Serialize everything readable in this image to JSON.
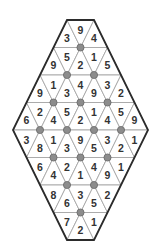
{
  "puzzle": {
    "type": "triangular-hexagon-number-grid",
    "rows": [
      [
        "3",
        "9",
        "4"
      ],
      [
        "9",
        "5",
        "2",
        "1",
        "5"
      ],
      [
        "9",
        "1",
        "3",
        "4",
        "9",
        "3",
        "2"
      ],
      [
        "6",
        "2",
        "4",
        "5",
        "2",
        "1",
        "4",
        "5",
        "9"
      ],
      [
        "3",
        "8",
        "1",
        "3",
        "9",
        "5",
        "3",
        "2",
        "1"
      ],
      [
        "6",
        "4",
        "2",
        "1",
        "4",
        "9",
        "1"
      ],
      [
        "8",
        "6",
        "3",
        "5",
        "2"
      ],
      [
        "7",
        "2",
        "1"
      ]
    ],
    "dots": [
      [
        1
      ],
      [
        1,
        2
      ],
      [
        1,
        2,
        3
      ],
      [
        1,
        2,
        3,
        4
      ],
      [
        1,
        2,
        3
      ],
      [
        1,
        2
      ],
      [
        1
      ]
    ],
    "colors": {
      "border": "#2b2b2b",
      "grid_line": "#a6a6a6",
      "dot_fill": "#8c8c8c",
      "number": "#333333"
    }
  }
}
